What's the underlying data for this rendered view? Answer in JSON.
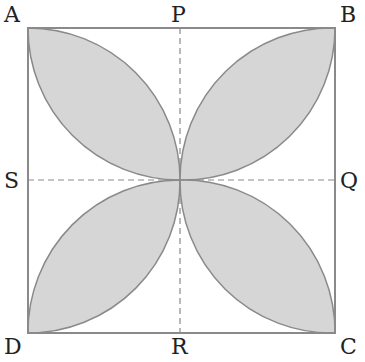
{
  "diagram": {
    "labels": {
      "A": "A",
      "B": "B",
      "C": "C",
      "D": "D",
      "P": "P",
      "Q": "Q",
      "R": "R",
      "S": "S"
    },
    "colors": {
      "fill": "#d6d6d6",
      "stroke": "#8a8a8a",
      "border": "#8a8a8a"
    }
  }
}
